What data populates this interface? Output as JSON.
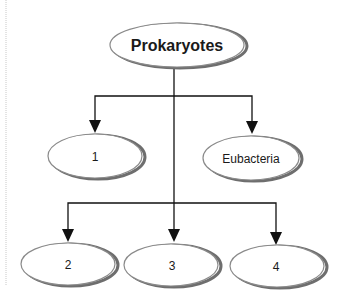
{
  "diagram": {
    "root": {
      "label": "Prokaryotes"
    },
    "level1": [
      {
        "label": "1"
      },
      {
        "label": "Eubacteria"
      }
    ],
    "level2": [
      {
        "label": "2"
      },
      {
        "label": "3"
      },
      {
        "label": "4"
      }
    ]
  },
  "colors": {
    "line": "#111111",
    "ellipse_stroke": "#8a8a8a",
    "ellipse_shadow": "#6e6e6e",
    "margin_line": "#c8c8c8"
  }
}
